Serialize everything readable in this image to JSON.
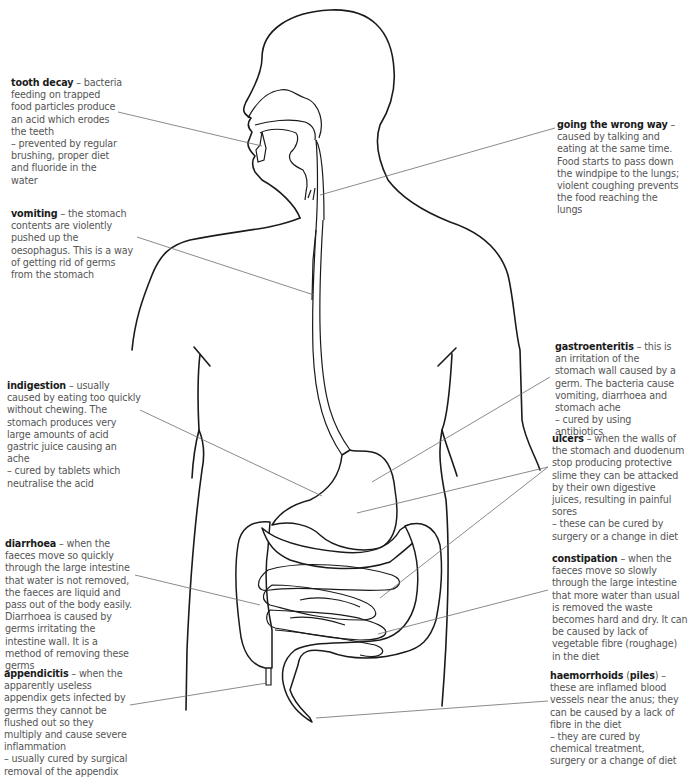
{
  "diagram": {
    "colors": {
      "outline": "#1a1a1a",
      "leader": "#6d6d6d",
      "term": "#1a1a1a",
      "text": "#555555",
      "background": "#ffffff"
    }
  },
  "labels": {
    "tooth_decay": {
      "term": "tooth decay",
      "text": " – bacteria feeding on trapped food particles produce an acid which erodes the teeth\n– prevented by regular brushing, proper diet and fluoride in the water"
    },
    "vomiting": {
      "term": "vomiting",
      "text": " – the stomach contents are violently pushed up the oesophagus. This is a way of getting rid of germs from the stomach"
    },
    "indigestion": {
      "term": "indigestion",
      "text": " – usually caused by eating too quickly without chewing. The stomach produces very large amounts of acid gastric juice causing an ache\n– cured by tablets which neutralise the acid"
    },
    "diarrhoea": {
      "term": "diarrhoea",
      "text": " – when the faeces move so quickly through the large intestine that water is not removed, the faeces are liquid and pass out of the body easily. Diarrhoea is caused by germs irritating the intestine wall. It is a method of removing these germs"
    },
    "appendicitis": {
      "term": "appendicitis",
      "text": " – when the apparently useless appendix gets infected by germs they cannot be flushed out so they multiply and cause severe inflammation\n– usually cured by surgical removal of the appendix"
    },
    "going_wrong_way": {
      "term": "going the wrong way",
      "text": " – caused by talking and eating at the same time. Food starts to pass down the windpipe to the lungs; violent coughing prevents the food reaching the lungs"
    },
    "gastroenteritis": {
      "term": "gastroenteritis",
      "text": " – this is an irritation of the stomach wall caused by a germ. The bacteria cause vomiting, diarrhoea and stomach ache\n– cured by using antibiotics"
    },
    "ulcers": {
      "term": "ulcers",
      "text": " – when the walls of the stomach and duodenum stop producing protective slime they can be attacked by their own digestive juices, resulting in painful sores\n– these can be cured by surgery or a change in diet"
    },
    "constipation": {
      "term": "constipation",
      "text": " – when the faeces move so slowly through the large intestine that more water than usual is removed the waste becomes hard and dry. It can be caused by lack of vegetable fibre (roughage) in the diet"
    },
    "haemorrhoids": {
      "term": "haemorrhoids",
      "paren_open": " (",
      "alt_term": "piles",
      "paren_close": ")",
      "text": " – these are inflamed blood vessels near the anus; they can be caused by a lack of fibre in the diet\n– they are cured by chemical treatment, surgery or a change of diet"
    }
  }
}
